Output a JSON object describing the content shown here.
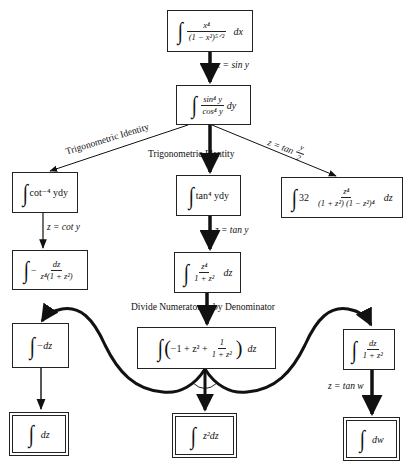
{
  "diagram": {
    "type": "integration-strategy-tree",
    "nodes": {
      "root": {
        "integrand_num": "x⁴",
        "integrand_den": "(1 − x²)⁵ᐟ²",
        "differential": "dx"
      },
      "trig_sub": {
        "integrand_num": "sin⁴ y",
        "integrand_den": "cos⁴ y",
        "differential": "dy"
      },
      "cot_form": {
        "expr": "cot⁻⁴ ydy"
      },
      "tan_form": {
        "expr": "tan⁴ ydy"
      },
      "half_angle_form": {
        "coef": "32",
        "integrand_num": "z⁴",
        "integrand_den": "(1 + z²) (1 − z²)⁴",
        "differential": "dz"
      },
      "cot_sub": {
        "sign": "−",
        "integrand_num": "dz",
        "integrand_den": "z⁴(1 + z²)"
      },
      "tan_sub": {
        "integrand_num": "z⁴",
        "integrand_den": "1 + z²",
        "differential": "dz"
      },
      "divided": {
        "open": "(",
        "terms": "−1 + z² +",
        "frac_num": "1",
        "frac_den": "1 + z²",
        "close": ")",
        "differential": "dz"
      },
      "neg_dz": {
        "expr": "−dz"
      },
      "arctan_form": {
        "integrand_num": "dz",
        "integrand_den": "1 + z²"
      },
      "final_dz": {
        "expr": "dz"
      },
      "final_z2dz": {
        "expr": "z²dz"
      },
      "final_dw": {
        "expr": "dw"
      }
    },
    "edge_labels": {
      "root_to_trig": "x = sin y",
      "trig_to_cot": "Trigonometric Identity",
      "trig_to_tan": "Trigonometric Identity",
      "trig_to_half_prefix": "z = tan",
      "trig_to_half_num": "y",
      "trig_to_half_den": "2",
      "cot_to_sub": "z = cot y",
      "tan_to_sub": "z = tan y",
      "divide": "Divide Numerator",
      "divide_2": "by Denominator",
      "arctan_to_dw": "z = tan w"
    },
    "integral_sign": "∫"
  }
}
